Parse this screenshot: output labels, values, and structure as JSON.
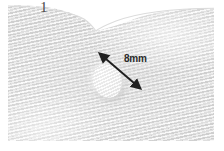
{
  "figure": {
    "panel_label": "1",
    "measurement_label": "8mm"
  },
  "annotations": {
    "caliper": {
      "name": "double-headed-measurement-arrow",
      "value": "8mm",
      "start": [
        97,
        53
      ],
      "end": [
        127,
        79
      ]
    },
    "lesion": {
      "name": "round-hypoechoic-nodule",
      "center": [
        99,
        76
      ],
      "width_px": 29,
      "height_px": 34
    },
    "notch": {
      "name": "v-shaped-surface-cleft",
      "apex": [
        38,
        25
      ]
    }
  },
  "colors": {
    "background": "#ffffff",
    "scan_base": "#eaeaea",
    "scan_light": "#f4f4f4",
    "scan_dark": "#c4c4c4",
    "arrow": "#1f1f1f",
    "label_text": "#2b2b2b",
    "panel_text": "#4a4a4a"
  }
}
